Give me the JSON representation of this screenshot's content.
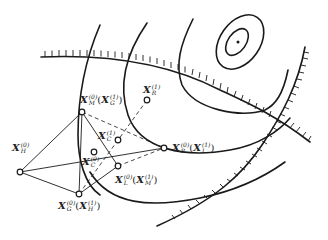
{
  "diagram": {
    "type": "complex-method-optimization",
    "colors": {
      "stroke": "#1a1a1a",
      "background": "#ffffff"
    },
    "points": [
      {
        "id": "XH0",
        "base": "X",
        "sub": "H",
        "sup": "(0)",
        "alt": "",
        "alt_sub": "",
        "alt_sup": ""
      },
      {
        "id": "XM0",
        "base": "X",
        "sub": "M",
        "sup": "(0)",
        "alt": "X",
        "alt_sub": "G",
        "alt_sup": "(1)"
      },
      {
        "id": "XR1",
        "base": "X",
        "sub": "R",
        "sup": "(1)",
        "alt": "",
        "alt_sub": "",
        "alt_sup": ""
      },
      {
        "id": "XC1",
        "base": "X",
        "sub": "C",
        "sup": "(1)",
        "alt": "",
        "alt_sub": "",
        "alt_sup": ""
      },
      {
        "id": "XR0",
        "base": "X",
        "sub": "R",
        "sup": "(0)",
        "alt": "X",
        "alt_sub": "L",
        "alt_sup": "(1)"
      },
      {
        "id": "XC0",
        "base": "X",
        "sub": "C",
        "sup": "(0)",
        "alt": "",
        "alt_sub": "",
        "alt_sup": ""
      },
      {
        "id": "XL0",
        "base": "X",
        "sub": "L",
        "sup": "(0)",
        "alt": "X",
        "alt_sub": "M",
        "alt_sup": "(1)"
      },
      {
        "id": "XG0",
        "base": "X",
        "sub": "G",
        "sup": "(0)",
        "alt": "X",
        "alt_sub": "H",
        "alt_sup": "(1)"
      }
    ],
    "labels": {
      "XH0": "X_H^(0)",
      "XM0": "X_M^(0)(X_G^(1))",
      "XR1": "X_R^(1)",
      "XC1": "X_C^(1)",
      "XR0": "X_R^(0)(X_L^(1))",
      "XC0": "X_C^(0)",
      "XL0": "X_L^(0)(X_M^(1))",
      "XG0": "X_G^(0)(X_H^(1))"
    }
  }
}
